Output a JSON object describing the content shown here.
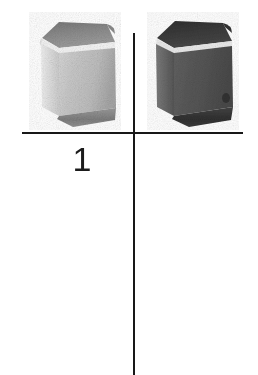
{
  "figure": {
    "label": "1",
    "caption_number": "1",
    "background_color": "#ffffff",
    "axis": {
      "line_color": "#181818",
      "horizontal": {
        "x_start": 22,
        "x_end": 243,
        "y": 132
      },
      "vertical": {
        "x": 133,
        "y_start": 33,
        "y_end": 375
      }
    },
    "objects": [
      {
        "name": "cube-light",
        "shape": "cube",
        "position": "upper-left-quadrant",
        "tone": "light-gray",
        "top_face_color": "#8b8b8b",
        "front_face_color": "#c3c3c3",
        "side_face_color": "#a9a9a9",
        "edge_highlight_color": "#f2f2f2",
        "bottom_edge_color": "#7c7c7c"
      },
      {
        "name": "cube-dark",
        "shape": "cube",
        "position": "upper-right-quadrant",
        "tone": "dark-gray",
        "top_face_color": "#3a3a3a",
        "front_face_color": "#5a5a5a",
        "side_face_color": "#4a4a4a",
        "edge_highlight_color": "#e8e8e8",
        "bottom_edge_color": "#333333"
      }
    ]
  }
}
